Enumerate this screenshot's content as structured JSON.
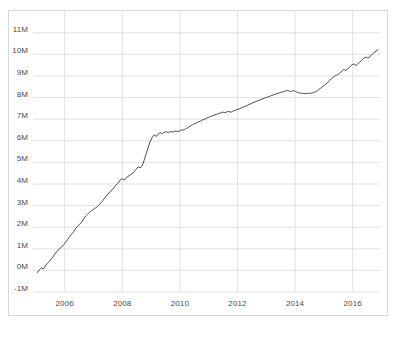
{
  "chart_data": {
    "type": "line",
    "title": "",
    "subtitle": "",
    "xlabel": "",
    "ylabel": "",
    "xlim": [
      2004.9,
      2016.95
    ],
    "ylim": [
      -1000000,
      11500000
    ],
    "grid": true,
    "legend": null,
    "y_tick_labels": [
      "11M",
      "10M",
      "9M",
      "8M",
      "7M",
      "6M",
      "5M",
      "4M",
      "3M",
      "2M",
      "1M",
      "0M",
      "-1M"
    ],
    "y_tick_values": [
      11000000,
      10000000,
      9000000,
      8000000,
      7000000,
      6000000,
      5000000,
      4000000,
      3000000,
      2000000,
      1000000,
      0,
      -1000000
    ],
    "x_tick_labels": [
      "2006",
      "2008",
      "2010",
      "2012",
      "2014",
      "2016"
    ],
    "x_tick_values": [
      2006,
      2008,
      2010,
      2012,
      2014,
      2016
    ],
    "line_color": "#4d4d4d",
    "line_width": 1,
    "series": [
      {
        "name": "cumulative total",
        "x": [
          2005.05,
          2005.12,
          2005.19,
          2005.26,
          2005.33,
          2005.4,
          2005.47,
          2005.54,
          2005.61,
          2005.68,
          2005.75,
          2005.82,
          2005.89,
          2005.96,
          2006.03,
          2006.1,
          2006.17,
          2006.24,
          2006.31,
          2006.38,
          2006.45,
          2006.52,
          2006.59,
          2006.66,
          2006.73,
          2006.8,
          2006.87,
          2006.94,
          2007.01,
          2007.08,
          2007.15,
          2007.22,
          2007.29,
          2007.36,
          2007.43,
          2007.5,
          2007.57,
          2007.64,
          2007.71,
          2007.78,
          2007.85,
          2007.92,
          2007.99,
          2008.06,
          2008.13,
          2008.2,
          2008.27,
          2008.34,
          2008.41,
          2008.48,
          2008.55,
          2008.62,
          2008.69,
          2008.76,
          2008.83,
          2008.9,
          2008.97,
          2009.04,
          2009.11,
          2009.18,
          2009.25,
          2009.32,
          2009.39,
          2009.46,
          2009.53,
          2009.6,
          2009.67,
          2009.74,
          2009.81,
          2009.88,
          2009.95,
          2010.02,
          2010.09,
          2010.16,
          2010.23,
          2010.3,
          2010.37,
          2010.44,
          2010.51,
          2010.58,
          2010.65,
          2010.72,
          2010.79,
          2010.86,
          2010.93,
          2011.0,
          2011.07,
          2011.14,
          2011.21,
          2011.28,
          2011.35,
          2011.42,
          2011.49,
          2011.56,
          2011.63,
          2011.7,
          2011.77,
          2011.84,
          2011.91,
          2011.98,
          2012.05,
          2012.12,
          2012.19,
          2012.26,
          2012.33,
          2012.4,
          2012.47,
          2012.54,
          2012.61,
          2012.68,
          2012.75,
          2012.82,
          2012.89,
          2012.96,
          2013.03,
          2013.1,
          2013.17,
          2013.24,
          2013.31,
          2013.38,
          2013.45,
          2013.52,
          2013.59,
          2013.66,
          2013.73,
          2013.8,
          2013.87,
          2013.94,
          2014.01,
          2014.08,
          2014.15,
          2014.22,
          2014.29,
          2014.36,
          2014.43,
          2014.5,
          2014.57,
          2014.64,
          2014.71,
          2014.78,
          2014.85,
          2014.92,
          2014.99,
          2015.06,
          2015.13,
          2015.2,
          2015.27,
          2015.34,
          2015.41,
          2015.48,
          2015.55,
          2015.62,
          2015.69,
          2015.76,
          2015.83,
          2015.9,
          2015.97,
          2016.04,
          2016.11,
          2016.18,
          2016.25,
          2016.32,
          2016.39,
          2016.46,
          2016.53,
          2016.6,
          2016.67,
          2016.74,
          2016.81,
          2016.88
        ],
        "y": [
          -100000,
          30000,
          120000,
          60000,
          210000,
          330000,
          420000,
          540000,
          660000,
          800000,
          900000,
          1010000,
          1080000,
          1180000,
          1300000,
          1420000,
          1560000,
          1680000,
          1790000,
          1940000,
          2050000,
          2140000,
          2230000,
          2380000,
          2520000,
          2610000,
          2700000,
          2780000,
          2830000,
          2900000,
          2970000,
          3070000,
          3180000,
          3300000,
          3420000,
          3530000,
          3630000,
          3730000,
          3830000,
          3950000,
          4030000,
          4180000,
          4250000,
          4180000,
          4270000,
          4350000,
          4420000,
          4480000,
          4560000,
          4680000,
          4790000,
          4750000,
          4830000,
          5100000,
          5400000,
          5700000,
          5980000,
          6150000,
          6280000,
          6200000,
          6320000,
          6380000,
          6330000,
          6400000,
          6420000,
          6380000,
          6430000,
          6400000,
          6440000,
          6450000,
          6420000,
          6480000,
          6500000,
          6520000,
          6570000,
          6630000,
          6690000,
          6740000,
          6790000,
          6830000,
          6880000,
          6920000,
          6970000,
          7000000,
          7050000,
          7090000,
          7130000,
          7160000,
          7200000,
          7230000,
          7260000,
          7290000,
          7330000,
          7300000,
          7340000,
          7360000,
          7320000,
          7370000,
          7410000,
          7440000,
          7470000,
          7510000,
          7560000,
          7590000,
          7630000,
          7680000,
          7720000,
          7760000,
          7800000,
          7840000,
          7880000,
          7910000,
          7950000,
          7990000,
          8020000,
          8050000,
          8090000,
          8120000,
          8160000,
          8190000,
          8220000,
          8250000,
          8270000,
          8300000,
          8330000,
          8300000,
          8280000,
          8330000,
          8290000,
          8240000,
          8210000,
          8200000,
          8190000,
          8180000,
          8190000,
          8210000,
          8200000,
          8230000,
          8270000,
          8320000,
          8400000,
          8470000,
          8550000,
          8620000,
          8700000,
          8790000,
          8880000,
          8960000,
          9030000,
          9060000,
          9130000,
          9230000,
          9300000,
          9260000,
          9330000,
          9420000,
          9510000,
          9560000,
          9480000,
          9560000,
          9650000,
          9730000,
          9820000,
          9880000,
          9830000,
          9900000,
          9990000,
          10080000,
          10150000,
          10230000
        ]
      }
    ]
  },
  "axes": {
    "y_ticks": [
      {
        "label": "11M",
        "value": 11000000
      },
      {
        "label": "10M",
        "value": 10000000
      },
      {
        "label": "9M",
        "value": 9000000
      },
      {
        "label": "8M",
        "value": 8000000
      },
      {
        "label": "7M",
        "value": 7000000
      },
      {
        "label": "6M",
        "value": 6000000
      },
      {
        "label": "5M",
        "value": 5000000
      },
      {
        "label": "4M",
        "value": 4000000
      },
      {
        "label": "3M",
        "value": 3000000
      },
      {
        "label": "2M",
        "value": 2000000
      },
      {
        "label": "1M",
        "value": 1000000
      },
      {
        "label": "0M",
        "value": 0
      },
      {
        "label": "-1M",
        "value": -1000000
      }
    ],
    "x_ticks": [
      {
        "label": "2006",
        "value": 2006
      },
      {
        "label": "2008",
        "value": 2008
      },
      {
        "label": "2010",
        "value": 2010
      },
      {
        "label": "2012",
        "value": 2012
      },
      {
        "label": "2014",
        "value": 2014
      },
      {
        "label": "2016",
        "value": 2016
      }
    ]
  },
  "style": {
    "grid_color": "#e2e2e2",
    "frame_color": "#d8d8d8",
    "line_color": "#4d4d4d",
    "tick_label_color": "#4a4a4a",
    "background": "#ffffff"
  },
  "caption": {
    "text": ""
  }
}
